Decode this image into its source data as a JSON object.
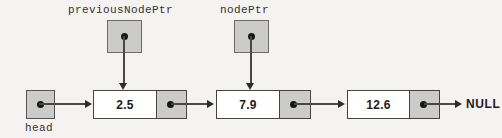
{
  "diagram": {
    "title_text": "",
    "background_color": "#f4f3f1",
    "fill_gray": "#cbcbc9",
    "border_color": "#46443f",
    "line_color": "#4a4846",
    "pointers": [
      {
        "label": "previousNodePtr",
        "target_node_index": 0
      },
      {
        "label": "nodePtr",
        "target_node_index": 1
      }
    ],
    "head": {
      "label": "head",
      "points_to_node_index": 0
    },
    "nodes": [
      {
        "value": "2.5",
        "next": "node-2"
      },
      {
        "value": "7.9",
        "next": "node-3"
      },
      {
        "value": "12.6",
        "next": "NULL"
      }
    ],
    "terminator": "NULL"
  }
}
